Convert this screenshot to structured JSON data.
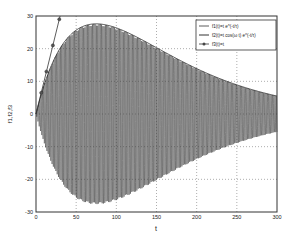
{
  "chart_data": {
    "type": "line",
    "title": "",
    "xlabel": "t",
    "ylabel": "f1,f2,f3",
    "xlim": [
      0,
      300
    ],
    "ylim": [
      -30,
      30
    ],
    "xticks": [
      0,
      50,
      100,
      150,
      200,
      250,
      300
    ],
    "yticks": [
      -30,
      -20,
      -10,
      0,
      10,
      20,
      30
    ],
    "grid": true,
    "legend_position": "upper right",
    "series": [
      {
        "name": "f1(t)=t e^(-t/τ)",
        "style": "solid line with small marks",
        "x": [
          0,
          25,
          50,
          75,
          100,
          125,
          150,
          175,
          200,
          225,
          250,
          275,
          300
        ],
        "values": [
          0,
          17.9,
          25.7,
          27.6,
          26.4,
          23.6,
          20.3,
          17.0,
          13.7,
          11.2,
          8.8,
          6.9,
          5.5
        ]
      },
      {
        "name": "f2(t)=t cos(ω t) e^(-t/τ)",
        "style": "dense oscillation filling envelope ±f1",
        "envelope_peak": {
          "t": 75,
          "value": 27.6
        },
        "value_at_300": 5.5
      },
      {
        "name": "f3(t)=t",
        "style": "line with circle markers",
        "x": [
          0,
          5,
          10,
          15,
          20,
          25,
          30
        ],
        "values": [
          0,
          5,
          10,
          15,
          20,
          25,
          30
        ]
      }
    ]
  },
  "legend": {
    "entries": [
      {
        "label": "f1(t)=t e^(-t/τ)"
      },
      {
        "label": "f2(t)=t cos(ω t) e^(-t/τ)"
      },
      {
        "label": "f3(t)=t"
      }
    ]
  },
  "axes": {
    "xlabel": "t",
    "ylabel": "f1,f2,f3"
  }
}
